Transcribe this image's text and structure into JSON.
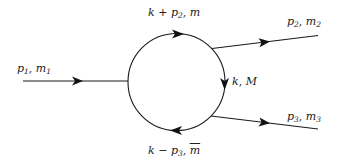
{
  "diagram": {
    "type": "feynman-one-loop-triangle",
    "colors": {
      "line": "#1a1a1a",
      "background": "#ffffff"
    },
    "incoming": {
      "momentum": "p",
      "momentum_index": "1",
      "mass": "m",
      "mass_index": "1",
      "sep": ","
    },
    "outgoing_top": {
      "momentum": "p",
      "momentum_index": "2",
      "mass": "m",
      "mass_index": "2",
      "sep": ","
    },
    "outgoing_bottom": {
      "momentum": "p",
      "momentum_index": "3",
      "mass": "m",
      "mass_index": "3",
      "sep": ","
    },
    "loop_top": {
      "k": "k",
      "op": "+",
      "momentum": "p",
      "momentum_index": "2",
      "sep": ",",
      "mass": "m"
    },
    "loop_right": {
      "k": "k",
      "sep": ",",
      "mass": "M"
    },
    "loop_bottom": {
      "k": "k",
      "op": "−",
      "momentum": "p",
      "momentum_index": "3",
      "sep": ",",
      "mass": "m"
    }
  }
}
